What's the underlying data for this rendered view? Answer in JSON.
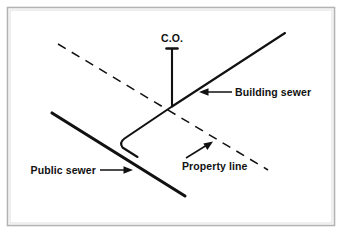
{
  "figure": {
    "background_color": "#ffffff",
    "border_color": "#b0b0b0",
    "line_color": "#111111"
  },
  "labels": {
    "cleanout": "C.O.",
    "building_sewer": "Building sewer",
    "public_sewer": "Public sewer",
    "property_line": "Property line"
  },
  "elements": {
    "cleanout_riser": "cleanout-riser-line",
    "cleanout_cap": "cleanout-cap",
    "building_sewer_line": "building-sewer-line",
    "public_sewer_line": "public-sewer-line",
    "property_line_dashed": "property-line-dashed",
    "lateral_connection": "lateral-connection-line",
    "building_sewer_leader": "building-sewer-leader-arrow",
    "public_sewer_leader": "public-sewer-leader-arrow",
    "property_line_leader": "property-line-leader-arrow"
  },
  "geometry": {
    "canvas": [
      342,
      233
    ],
    "junction_point": [
      172,
      106
    ],
    "cleanout_top": [
      172,
      48
    ],
    "building_sewer_end": [
      285,
      33
    ],
    "public_sewer_start": [
      52,
      113
    ],
    "public_sewer_end": [
      185,
      196
    ],
    "property_line_start": [
      58,
      44
    ],
    "property_line_end": [
      268,
      170
    ]
  }
}
